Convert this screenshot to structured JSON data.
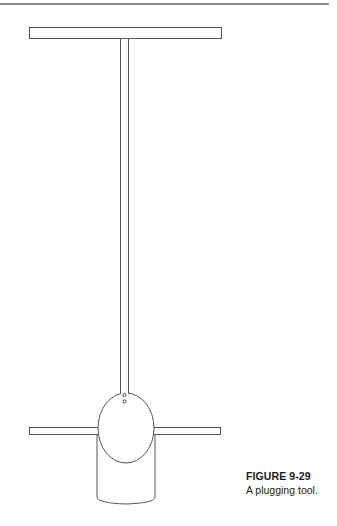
{
  "figure": {
    "label": "FIGURE 9-29",
    "caption": "A plugging tool.",
    "stroke_color": "#555555",
    "rule_color": "#8c8c8c",
    "parts": {
      "top_handle": {
        "x": 29,
        "y": 27,
        "width": 193,
        "height": 12
      },
      "shaft": {
        "x": 120,
        "y": 39,
        "width": 9,
        "height": 355
      },
      "ball": {
        "cx": 130,
        "cy": 428,
        "rx": 28,
        "ry": 35
      },
      "cross_bar": {
        "x": 29,
        "y": 427,
        "width": 192,
        "height": 8
      },
      "plug_body": {
        "x": 96,
        "y": 430,
        "width": 60,
        "height": 73
      },
      "rivets": [
        {
          "cx": 124,
          "cy": 395
        },
        {
          "cx": 124,
          "cy": 402
        }
      ]
    }
  }
}
